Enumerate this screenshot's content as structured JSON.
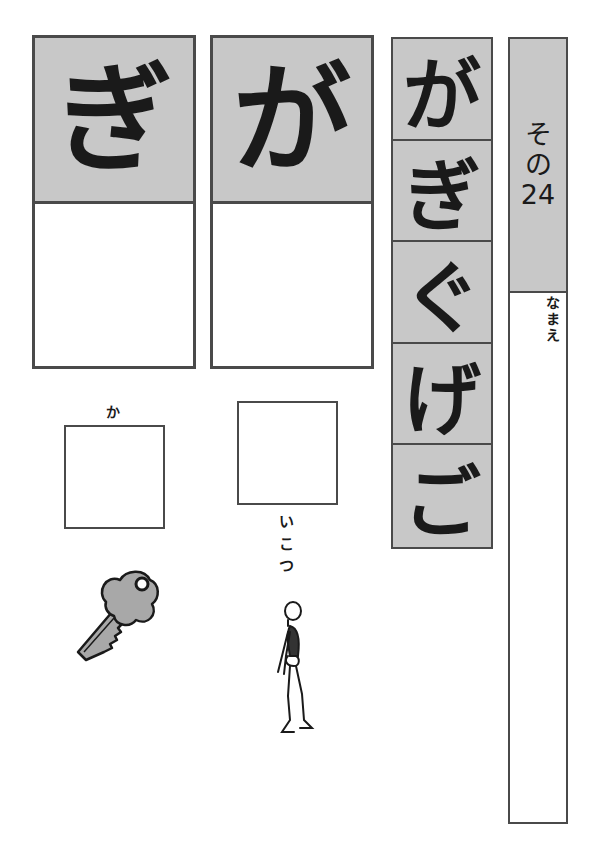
{
  "worksheet": {
    "number_label": [
      "そ",
      "の",
      "24"
    ],
    "name_label": [
      "な",
      "ま",
      "え"
    ]
  },
  "practice_cards": [
    {
      "character": "ぎ"
    },
    {
      "character": "が"
    }
  ],
  "kana_row": [
    "が",
    "ぎ",
    "ぐ",
    "げ",
    "ご"
  ],
  "exercises": [
    {
      "hint_before": "か",
      "hint_after": "",
      "picture": "key-icon",
      "answer": "ぎ"
    },
    {
      "hint_before": "",
      "hint_after": [
        "い",
        "こ",
        "つ"
      ],
      "picture": "skeleton-icon",
      "answer": "が"
    }
  ],
  "colors": {
    "cell_gray": "#c8c8c8",
    "border": "#4a4a4a",
    "ink": "#1a1a1a"
  }
}
